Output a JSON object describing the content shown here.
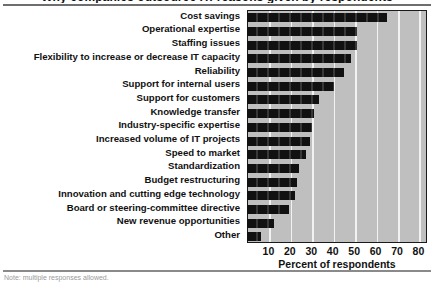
{
  "figure": {
    "title_clipped": "Why companies outsource IT: reasons given by respondents",
    "source_clipped": "Note: multiple responses allowed."
  },
  "chart_data": {
    "type": "bar",
    "orientation": "horizontal",
    "title": "",
    "xlabel": "Percent of respondents",
    "ylabel": "",
    "xlim": [
      0,
      84
    ],
    "grid": true,
    "legend": false,
    "xticks": [
      10,
      20,
      30,
      40,
      50,
      60,
      70,
      80
    ],
    "categories": [
      "Cost savings",
      "Operational expertise",
      "Staffing issues",
      "Flexibility to increase or decrease IT capacity",
      "Reliability",
      "Support for internal users",
      "Support for customers",
      "Knowledge transfer",
      "Industry-specific expertise",
      "Increased volume of IT projects",
      "Speed to market",
      "Standardization",
      "Budget restructuring",
      "Innovation and cutting edge technology",
      "Board or steering-committee directive",
      "New revenue opportunities",
      "Other"
    ],
    "values": [
      65,
      51,
      51,
      48,
      45,
      40,
      33,
      31,
      30,
      29,
      27,
      24,
      23,
      22,
      19,
      12,
      6
    ],
    "bar_color": "#111111",
    "plot_background": "#bfbfbf",
    "gridline_color": "#f2f2f2"
  }
}
